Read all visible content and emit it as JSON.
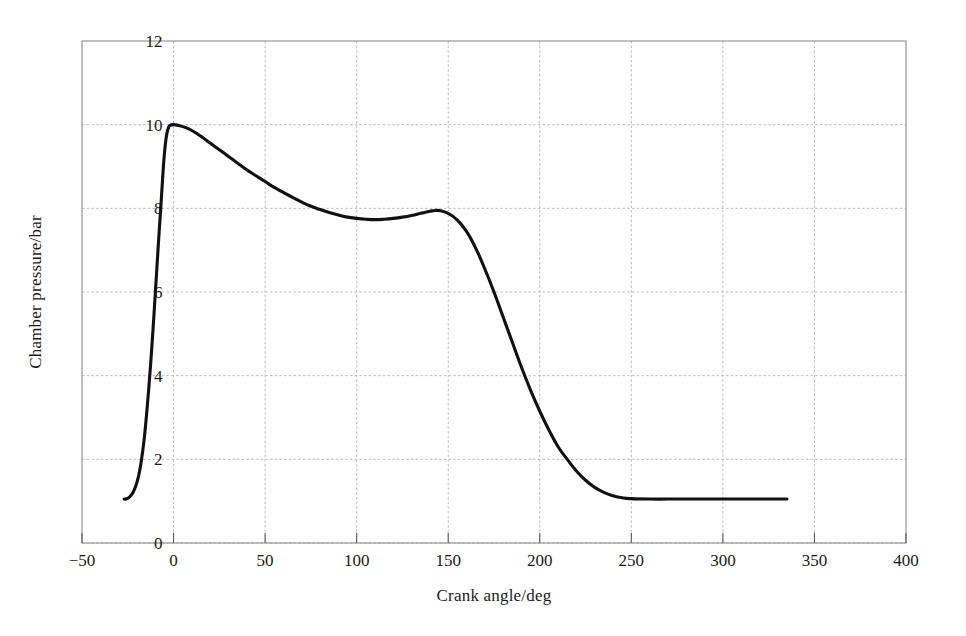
{
  "chart_data": {
    "type": "line",
    "title": "",
    "subtitle": "",
    "xlabel": "Crank angle/deg",
    "ylabel": "Chamber pressure/bar",
    "xlim": [
      -50,
      400
    ],
    "ylim": [
      0,
      12
    ],
    "xticks": [
      -50,
      0,
      50,
      100,
      150,
      200,
      250,
      300,
      350,
      400
    ],
    "xtick_labels": [
      "−50",
      "0",
      "50",
      "100",
      "150",
      "200",
      "250",
      "300",
      "350",
      "400"
    ],
    "yticks": [
      0,
      2,
      4,
      6,
      8,
      10,
      12
    ],
    "ytick_labels": [
      "0",
      "2",
      "4",
      "6",
      "8",
      "10",
      "12"
    ],
    "grid": true,
    "legend": null,
    "legend_position": "none",
    "annotations": [],
    "series": [
      {
        "name": "Chamber pressure",
        "color": "#111111",
        "x": [
          -27,
          -26,
          -25,
          -24,
          -23,
          -22,
          -21,
          -20,
          -19,
          -18,
          -17,
          -16,
          -15,
          -14,
          -13,
          -12,
          -11,
          -10,
          -9,
          -8,
          -7,
          -6,
          -5,
          -4,
          -3,
          -2,
          0,
          3,
          6,
          10,
          15,
          20,
          25,
          30,
          35,
          40,
          45,
          50,
          55,
          60,
          65,
          70,
          75,
          80,
          85,
          90,
          95,
          100,
          105,
          110,
          115,
          120,
          125,
          130,
          135,
          140,
          143,
          146,
          150,
          155,
          160,
          165,
          170,
          175,
          180,
          185,
          190,
          195,
          200,
          205,
          210,
          215,
          220,
          225,
          230,
          235,
          240,
          245,
          250,
          260,
          270,
          280,
          290,
          300,
          310,
          320,
          330,
          335
        ],
        "y": [
          1.05,
          1.05,
          1.07,
          1.1,
          1.15,
          1.22,
          1.32,
          1.45,
          1.62,
          1.85,
          2.15,
          2.5,
          2.95,
          3.45,
          4.0,
          4.6,
          5.25,
          5.95,
          6.65,
          7.35,
          8.0,
          8.7,
          9.3,
          9.7,
          9.9,
          9.98,
          10.0,
          9.98,
          9.94,
          9.86,
          9.72,
          9.56,
          9.4,
          9.24,
          9.08,
          8.92,
          8.78,
          8.64,
          8.5,
          8.38,
          8.26,
          8.15,
          8.05,
          7.97,
          7.9,
          7.84,
          7.79,
          7.76,
          7.74,
          7.73,
          7.74,
          7.76,
          7.79,
          7.83,
          7.88,
          7.93,
          7.95,
          7.94,
          7.88,
          7.72,
          7.45,
          7.05,
          6.55,
          6.0,
          5.4,
          4.8,
          4.2,
          3.65,
          3.15,
          2.7,
          2.3,
          2.0,
          1.72,
          1.5,
          1.33,
          1.21,
          1.13,
          1.08,
          1.06,
          1.05,
          1.05,
          1.05,
          1.05,
          1.05,
          1.05,
          1.05,
          1.05,
          1.05
        ]
      }
    ],
    "notes": {
      "peak_pressure": 10.0,
      "peak_crank_angle": 0,
      "local_min_pressure": 7.73,
      "local_min_crank_angle": 110,
      "secondary_peak_pressure": 7.95,
      "secondary_peak_crank_angle": 143,
      "exhaust_plateau_pressure": 1.05,
      "curve_start_crank_angle": -27,
      "curve_end_crank_angle": 335
    }
  }
}
